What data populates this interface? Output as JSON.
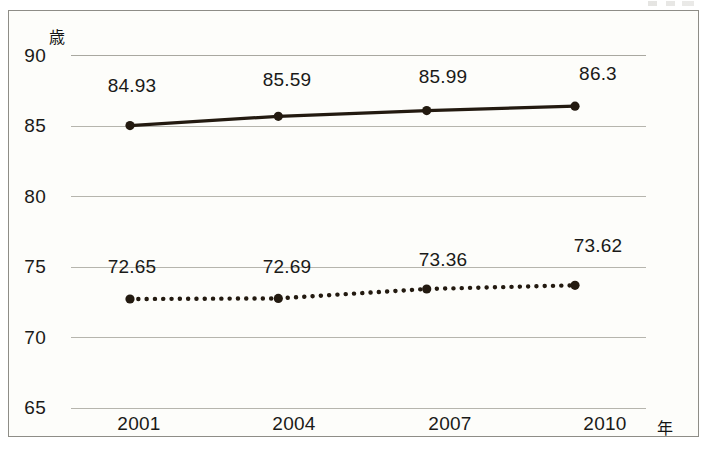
{
  "chart_data": {
    "type": "line",
    "title": "",
    "xlabel": "年",
    "ylabel": "歳",
    "ylim": [
      65,
      90
    ],
    "yticks": [
      65,
      70,
      75,
      80,
      85,
      90
    ],
    "grid": true,
    "legend": "none",
    "categories": [
      "2001",
      "2004",
      "2007",
      "2010"
    ],
    "series": [
      {
        "name": "female",
        "style": "solid",
        "color": "#231a10",
        "values": [
          84.93,
          85.59,
          85.99,
          86.3
        ],
        "labels": [
          "84.93",
          "85.59",
          "85.99",
          "86.3"
        ]
      },
      {
        "name": "male",
        "style": "dotted",
        "color": "#231a10",
        "values": [
          72.65,
          72.69,
          73.36,
          73.62
        ],
        "labels": [
          "72.65",
          "72.69",
          "73.36",
          "73.62"
        ]
      }
    ]
  },
  "axes": {
    "y_unit": "歳",
    "x_unit": "年",
    "y_tick_labels": [
      "90",
      "85",
      "80",
      "75",
      "70",
      "65"
    ],
    "x_tick_labels": [
      "2001",
      "2004",
      "2007",
      "2010"
    ]
  },
  "colors": {
    "frame": "#8e8d87",
    "gridline": "#b6b5ad",
    "series": "#231a10",
    "background": "#fdfdfa",
    "text": "#1a1a18"
  }
}
